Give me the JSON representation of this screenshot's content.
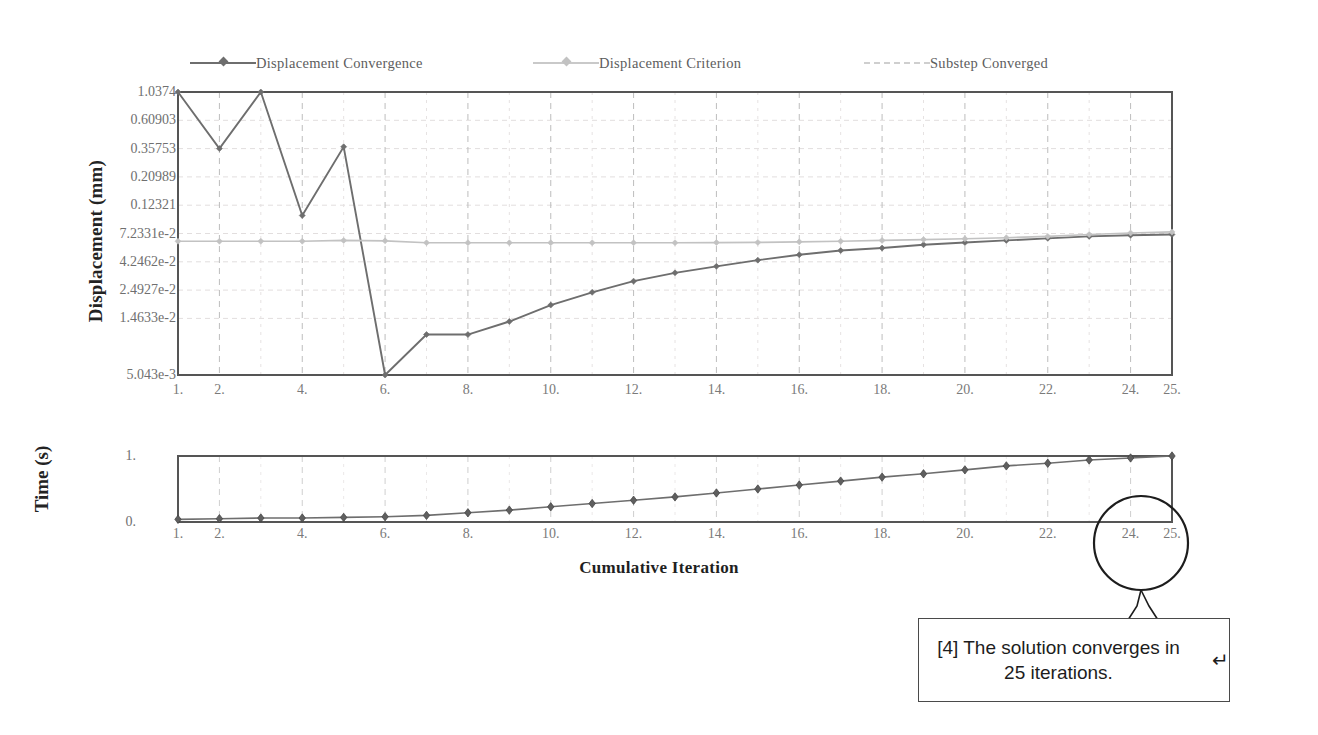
{
  "legend": {
    "items": [
      {
        "label": "Displacement Convergence",
        "style": "solid-marker-dark",
        "color": "#6e6e6e",
        "x": 8
      },
      {
        "label": "Displacement Criterion",
        "style": "solid-marker-light",
        "color": "#c2c2c2",
        "x": 350
      },
      {
        "label": "Substep Converged",
        "style": "dashed-light",
        "color": "#cfcfcf",
        "x": 680
      }
    ]
  },
  "top_chart": {
    "ylabel": "Displacement (mm)",
    "yticks": [
      "1.0374",
      "0.60903",
      "0.35753",
      "0.20989",
      "0.12321",
      "7.2331e-2",
      "4.2462e-2",
      "2.4927e-2",
      "1.4633e-2",
      "5.043e-3"
    ],
    "xticks": [
      "1.",
      "2.",
      "4.",
      "6.",
      "8.",
      "10.",
      "12.",
      "14.",
      "16.",
      "18.",
      "20.",
      "22.",
      "24.",
      "25."
    ]
  },
  "bottom_chart": {
    "ylabel": "Time (s)",
    "yticks": [
      "1.",
      "0."
    ],
    "xticks": [
      "1.",
      "2.",
      "4.",
      "6.",
      "8.",
      "10.",
      "12.",
      "14.",
      "16.",
      "18.",
      "20.",
      "22.",
      "24.",
      "25."
    ]
  },
  "xaxis_title": "Cumulative Iteration",
  "callout": {
    "text": "[4] The solution converges in 25 iterations.",
    "return_glyph": "↵"
  },
  "chart_data": {
    "type": "line",
    "title": "",
    "charts": [
      {
        "name": "displacement-convergence-chart",
        "type": "line",
        "xlabel": "Cumulative Iteration",
        "ylabel": "Displacement (mm)",
        "yscale": "log",
        "ylim": [
          0.005043,
          1.0374
        ],
        "xlim": [
          1,
          25
        ],
        "grid": true,
        "ytick_values": [
          1.0374,
          0.60903,
          0.35753,
          0.20989,
          0.12321,
          0.072331,
          0.042462,
          0.024927,
          0.014633,
          0.005043
        ],
        "ytick_labels": [
          "1.0374",
          "0.60903",
          "0.35753",
          "0.20989",
          "0.12321",
          "7.2331e-2",
          "4.2462e-2",
          "2.4927e-2",
          "1.4633e-2",
          "5.043e-3"
        ],
        "xtick_values": [
          1,
          2,
          4,
          6,
          8,
          10,
          12,
          14,
          16,
          18,
          20,
          22,
          24,
          25
        ],
        "xtick_labels": [
          "1.",
          "2.",
          "4.",
          "6.",
          "8.",
          "10.",
          "12.",
          "14.",
          "16.",
          "18.",
          "20.",
          "22.",
          "24.",
          "25."
        ],
        "x": [
          1,
          2,
          3,
          4,
          5,
          6,
          7,
          8,
          9,
          10,
          11,
          12,
          13,
          14,
          15,
          16,
          17,
          18,
          19,
          20,
          21,
          22,
          23,
          24,
          25
        ],
        "series": [
          {
            "name": "Displacement Convergence",
            "color": "#6e6e6e",
            "marker": "diamond",
            "values": [
              1.0374,
              0.35753,
              1.0374,
              0.1015,
              0.37,
              0.005043,
              0.0108,
              0.0108,
              0.0138,
              0.0188,
              0.0239,
              0.0295,
              0.0345,
              0.039,
              0.0438,
              0.0485,
              0.0525,
              0.055,
              0.0585,
              0.061,
              0.0635,
              0.066,
              0.0685,
              0.07,
              0.071
            ]
          },
          {
            "name": "Displacement Criterion",
            "color": "#c2c2c2",
            "marker": "diamond",
            "values": [
              0.0625,
              0.0625,
              0.0625,
              0.0625,
              0.0635,
              0.063,
              0.0608,
              0.0608,
              0.0608,
              0.0608,
              0.0608,
              0.0608,
              0.0608,
              0.061,
              0.0612,
              0.0618,
              0.0625,
              0.0635,
              0.0645,
              0.0655,
              0.0668,
              0.0685,
              0.071,
              0.073,
              0.0745
            ]
          },
          {
            "name": "Substep Converged",
            "color": "#cfcfcf",
            "marker": "none",
            "values": []
          }
        ]
      },
      {
        "name": "time-chart",
        "type": "line",
        "xlabel": "Cumulative Iteration",
        "ylabel": "Time (s)",
        "yscale": "linear",
        "ylim": [
          0,
          1
        ],
        "xlim": [
          1,
          25
        ],
        "grid": true,
        "ytick_values": [
          1,
          0
        ],
        "ytick_labels": [
          "1.",
          "0."
        ],
        "xtick_values": [
          1,
          2,
          4,
          6,
          8,
          10,
          12,
          14,
          16,
          18,
          20,
          22,
          24,
          25
        ],
        "xtick_labels": [
          "1.",
          "2.",
          "4.",
          "6.",
          "8.",
          "10.",
          "12.",
          "14.",
          "16.",
          "18.",
          "20.",
          "22.",
          "24.",
          "25."
        ],
        "x": [
          1,
          2,
          3,
          4,
          5,
          6,
          7,
          8,
          9,
          10,
          11,
          12,
          13,
          14,
          15,
          16,
          17,
          18,
          19,
          20,
          21,
          22,
          23,
          24,
          25
        ],
        "series": [
          {
            "name": "Time",
            "color": "#6e6e6e",
            "marker": "diamond",
            "values": [
              0.04,
              0.05,
              0.06,
              0.06,
              0.07,
              0.08,
              0.1,
              0.14,
              0.18,
              0.23,
              0.28,
              0.33,
              0.38,
              0.44,
              0.5,
              0.56,
              0.62,
              0.68,
              0.73,
              0.79,
              0.85,
              0.89,
              0.94,
              0.97,
              1.0
            ]
          }
        ]
      }
    ]
  }
}
